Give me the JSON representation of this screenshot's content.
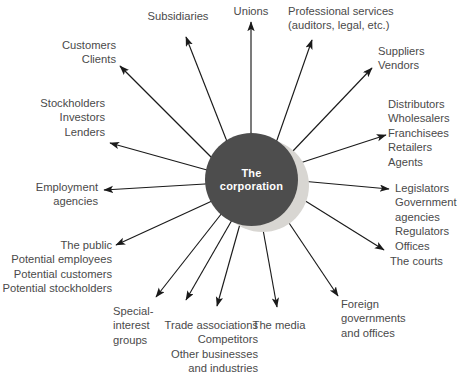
{
  "diagram": {
    "type": "hub-and-spoke radial stakeholder map",
    "hub": {
      "label_line1": "The",
      "label_line2": "corporation",
      "fill_color": "#4d4d4d",
      "text_color": "#ffffff",
      "shadow_color": "#d8d6d2"
    },
    "text_color": "#4a4a4a",
    "background_color": "#ffffff",
    "arrow_color": "#1a1a1a",
    "arrow_style": "double-headed",
    "spoke_count": 16,
    "nodes": [
      {
        "id": "subsidiaries",
        "lines": [
          "Subsidiaries"
        ],
        "align": "center"
      },
      {
        "id": "unions",
        "lines": [
          "Unions"
        ],
        "align": "center"
      },
      {
        "id": "professional-services",
        "lines": [
          "Professional services",
          "(auditors, legal, etc.)"
        ],
        "align": "left"
      },
      {
        "id": "customers-clients",
        "lines": [
          "Customers",
          "Clients"
        ],
        "align": "right"
      },
      {
        "id": "suppliers-vendors",
        "lines": [
          "Suppliers",
          "Vendors"
        ],
        "align": "left"
      },
      {
        "id": "stockholders-investors-lenders",
        "lines": [
          "Stockholders",
          "Investors",
          "Lenders"
        ],
        "align": "right"
      },
      {
        "id": "distributors-group",
        "lines": [
          "Distributors",
          "Wholesalers",
          "Franchisees",
          "Retailers",
          "Agents"
        ],
        "align": "left"
      },
      {
        "id": "employment-agencies",
        "lines": [
          "Employment",
          "agencies"
        ],
        "align": "right"
      },
      {
        "id": "legislators-group",
        "lines": [
          "Legislators",
          "Government",
          "agencies",
          "Regulators",
          "Offices"
        ],
        "align": "left"
      },
      {
        "id": "the-public-group",
        "lines": [
          "The public",
          "Potential employees",
          "Potential customers",
          "Potential stockholders"
        ],
        "align": "right"
      },
      {
        "id": "the-courts",
        "lines": [
          "The courts"
        ],
        "align": "left"
      },
      {
        "id": "special-interest-groups",
        "lines": [
          "Special-",
          "interest",
          "groups"
        ],
        "align": "left"
      },
      {
        "id": "trade-associations-group",
        "lines": [
          "Trade associations",
          "Competitors",
          "Other businesses",
          "and industries"
        ],
        "align": "right"
      },
      {
        "id": "the-media",
        "lines": [
          "The media"
        ],
        "align": "center"
      },
      {
        "id": "foreign-governments",
        "lines": [
          "Foreign",
          "governments",
          "and offices"
        ],
        "align": "left"
      }
    ]
  }
}
